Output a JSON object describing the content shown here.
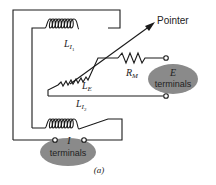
{
  "diagram": {
    "caption": "(a)",
    "pointer_label": "Pointer",
    "coils": {
      "li1": {
        "main": "L",
        "sub": "I",
        "subsub": "1"
      },
      "li2": {
        "main": "L",
        "sub": "I",
        "subsub": "2"
      },
      "le": {
        "main": "L",
        "sub": "E"
      }
    },
    "resistor": {
      "main": "R",
      "sub": "M"
    },
    "e_terminals": {
      "symbol": "E",
      "label": "terminals",
      "fill": "#8a8a8a"
    },
    "i_terminals": {
      "symbol": "I",
      "label": "terminals",
      "fill": "#8a8a8a"
    },
    "line_color": "#1a1a1a"
  }
}
